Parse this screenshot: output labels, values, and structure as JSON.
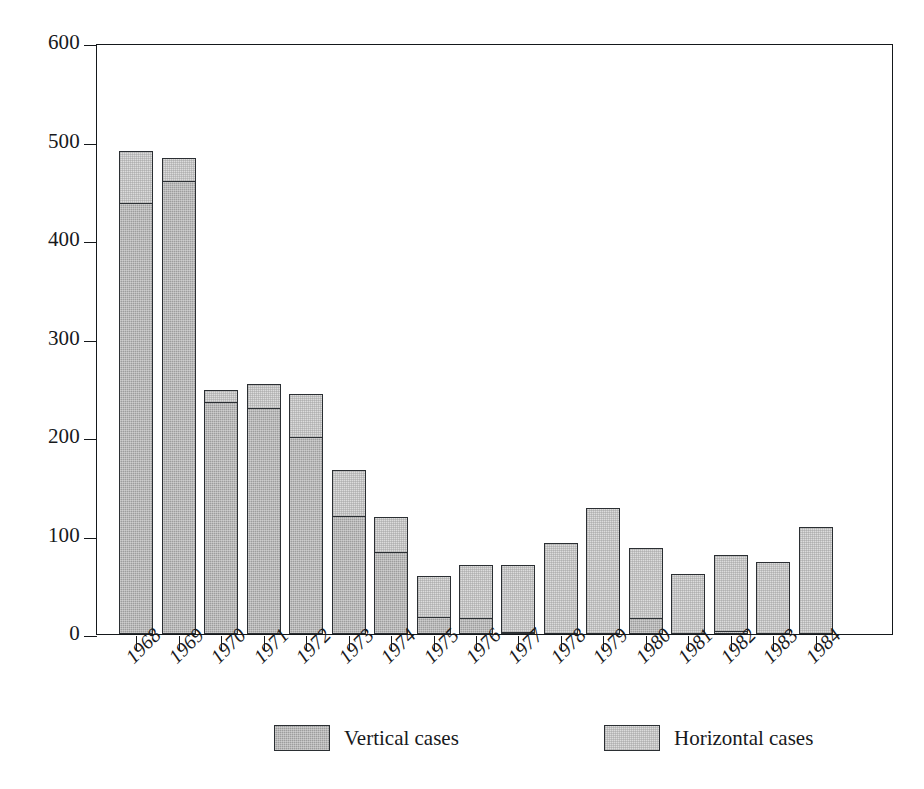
{
  "chart_data": {
    "type": "bar",
    "subtype": "stacked-vertical-bar",
    "title": "",
    "subtitle": "",
    "xlabel": "",
    "ylabel": "",
    "categories": [
      "1968",
      "1969",
      "1970",
      "1971",
      "1972",
      "1973",
      "1974",
      "1975",
      "1976",
      "1977",
      "1978",
      "1979",
      "1980",
      "1981",
      "1982",
      "1983",
      "1984"
    ],
    "series": [
      {
        "name": "Vertical cases",
        "color": "#9d9d9d",
        "values": [
          438,
          460,
          236,
          230,
          201,
          120,
          84,
          18,
          17,
          3,
          -2,
          -1,
          17,
          -2,
          4,
          -2,
          -4
        ]
      },
      {
        "name": "Horizontal cases",
        "color": "#dcdcdc",
        "values": [
          54,
          25,
          13,
          25,
          44,
          48,
          36,
          42,
          55,
          69,
          92,
          128,
          72,
          61,
          78,
          73,
          109
        ]
      }
    ],
    "totals": [
      492,
      485,
      249,
      255,
      245,
      168,
      120,
      60,
      72,
      72,
      90,
      127,
      89,
      59,
      82,
      71,
      105
    ],
    "ylim": [
      0,
      600
    ],
    "yticks": [
      0,
      100,
      200,
      300,
      400,
      500,
      600
    ],
    "ytick_labels": [
      "0",
      "100",
      "200",
      "300",
      "400",
      "500",
      "600"
    ],
    "grid": false,
    "legend_position": "bottom-center",
    "legend_entries": [
      "Vertical cases",
      "Horizontal cases"
    ],
    "stacked": true,
    "bar_count": 17
  },
  "legend": {
    "entries": [
      {
        "label": "Vertical cases",
        "swatch": "dark-gray"
      },
      {
        "label": "Horizontal cases",
        "swatch": "light-gray"
      }
    ]
  },
  "caption": {
    "sliver_text": ""
  }
}
